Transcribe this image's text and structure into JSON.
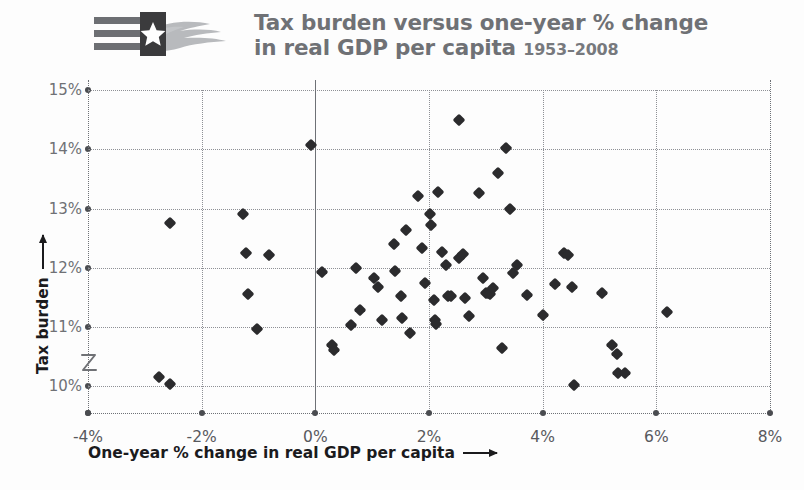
{
  "header": {
    "logo_name": "texas-flag-hand-logo",
    "title_line1": "Tax burden versus one-year % change",
    "title_line2": "in real GDP per capita",
    "title_years": "1953–2008"
  },
  "axes": {
    "x_title": "One-year % change in real GDP per capita",
    "y_title": "Tax burden",
    "x_ticks": [
      "-4%",
      "-2%",
      "0%",
      "2%",
      "4%",
      "6%",
      "8%"
    ],
    "y_ticks": [
      "15%",
      "14%",
      "13%",
      "12%",
      "11%",
      "10%"
    ],
    "axis_break_symbol": "z"
  },
  "colors": {
    "marker": "#2b2b2d",
    "grid": "#8e9095",
    "title": "#6f7175",
    "axis_text": "#58595d",
    "axis_title": "#1b1b1d",
    "flag_dark": "#3b3b3d",
    "flag_stripe": "#6d6f73",
    "hand": "#b8babd"
  },
  "chart_data": {
    "type": "scatter",
    "title": "Tax burden versus one-year % change in real GDP per capita 1953–2008",
    "xlabel": "One-year % change in real GDP per capita",
    "ylabel": "Tax burden",
    "xlim": [
      -4,
      8
    ],
    "ylim": [
      9.55,
      15
    ],
    "xticks": [
      -4,
      -2,
      0,
      2,
      4,
      6,
      8
    ],
    "yticks": [
      10,
      11,
      12,
      13,
      14,
      15
    ],
    "xtick_format": "percent",
    "ytick_format": "percent",
    "grid": true,
    "legend": "none",
    "y_axis_break_below": 10,
    "marker": "diamond",
    "points": [
      [
        -2.55,
        12.76
      ],
      [
        -2.75,
        10.15
      ],
      [
        -2.55,
        10.04
      ],
      [
        -1.28,
        12.91
      ],
      [
        -1.22,
        12.25
      ],
      [
        -0.82,
        12.21
      ],
      [
        -1.18,
        11.56
      ],
      [
        -1.02,
        10.97
      ],
      [
        -0.08,
        14.08
      ],
      [
        0.12,
        11.93
      ],
      [
        0.3,
        10.7
      ],
      [
        0.33,
        10.61
      ],
      [
        0.62,
        11.04
      ],
      [
        0.72,
        12.0
      ],
      [
        0.78,
        11.28
      ],
      [
        1.03,
        11.82
      ],
      [
        1.1,
        11.67
      ],
      [
        1.18,
        11.12
      ],
      [
        1.38,
        12.4
      ],
      [
        1.41,
        11.95
      ],
      [
        1.5,
        11.52
      ],
      [
        1.52,
        11.15
      ],
      [
        1.6,
        12.64
      ],
      [
        1.66,
        10.9
      ],
      [
        1.81,
        13.21
      ],
      [
        1.88,
        12.33
      ],
      [
        1.93,
        11.74
      ],
      [
        2.02,
        12.9
      ],
      [
        2.04,
        12.72
      ],
      [
        2.08,
        11.46
      ],
      [
        2.1,
        11.12
      ],
      [
        2.13,
        11.05
      ],
      [
        2.16,
        13.28
      ],
      [
        2.22,
        12.26
      ],
      [
        2.3,
        12.05
      ],
      [
        2.33,
        11.52
      ],
      [
        2.38,
        11.52
      ],
      [
        2.52,
        14.5
      ],
      [
        2.53,
        12.17
      ],
      [
        2.6,
        12.23
      ],
      [
        2.64,
        11.49
      ],
      [
        2.7,
        11.18
      ],
      [
        2.88,
        13.27
      ],
      [
        2.95,
        11.82
      ],
      [
        3.0,
        11.58
      ],
      [
        3.04,
        11.57
      ],
      [
        3.08,
        11.55
      ],
      [
        3.13,
        11.66
      ],
      [
        3.22,
        13.6
      ],
      [
        3.28,
        10.64
      ],
      [
        3.35,
        14.02
      ],
      [
        3.42,
        13.0
      ],
      [
        3.48,
        11.92
      ],
      [
        3.55,
        12.04
      ],
      [
        3.72,
        11.54
      ],
      [
        4.0,
        11.2
      ],
      [
        4.22,
        11.72
      ],
      [
        4.38,
        12.25
      ],
      [
        4.45,
        12.22
      ],
      [
        4.52,
        11.68
      ],
      [
        4.55,
        10.02
      ],
      [
        5.05,
        11.58
      ],
      [
        5.22,
        10.7
      ],
      [
        5.3,
        10.55
      ],
      [
        5.32,
        10.22
      ],
      [
        5.45,
        10.22
      ],
      [
        6.18,
        11.25
      ]
    ]
  }
}
